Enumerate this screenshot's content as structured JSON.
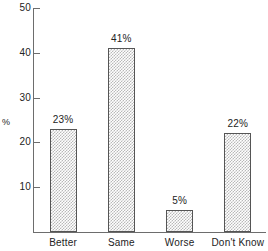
{
  "chart_data": {
    "type": "bar",
    "title": "",
    "xlabel": "",
    "ylabel": "%",
    "categories": [
      "Better",
      "Same",
      "Worse",
      "Don't Know"
    ],
    "values": [
      23,
      41,
      5,
      22
    ],
    "data_labels": [
      "23%",
      "41%",
      "5%",
      "22%"
    ],
    "ylim": [
      0,
      50
    ],
    "yticks": [
      10,
      20,
      30,
      40,
      50
    ],
    "ytick_labels": [
      "10",
      "20",
      "30",
      "40",
      "50"
    ],
    "grid": false,
    "legend": null,
    "colors": {
      "bar_fill": "#b9b9b9",
      "bar_border": "#555555",
      "axis": "#6d6d6d",
      "text": "#232323",
      "background": "#ffffff"
    }
  }
}
